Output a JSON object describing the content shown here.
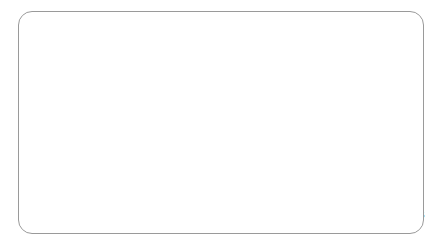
{
  "figure": {
    "frame_border_color": "#9a9a9a",
    "plot_background": "#e9e9e9",
    "page_background": "#ffffff"
  },
  "chart_data": {
    "type": "line",
    "title": "",
    "subtitle": "",
    "xlabel": "",
    "ylabel": "Age in years",
    "ylim": [
      35,
      65
    ],
    "yticks": [
      35,
      40,
      45,
      50,
      55,
      60,
      65
    ],
    "ytick_labels": [
      "35",
      "40",
      "45",
      "50",
      "55",
      "60",
      "65"
    ],
    "grid": "vertical-only",
    "legend_position": "top-left-inside",
    "x": [
      "1950–55",
      "1955–60",
      "1960–65",
      "1965–70",
      "1970–75",
      "1975–80",
      "1980–85",
      "1985–90",
      "1990–95",
      "1995–2000",
      "2000–05"
    ],
    "xtick_labels_shown": [
      "1950–55",
      "1960–65",
      "1970–75",
      "1980–85",
      "1990–95",
      "2000–05"
    ],
    "xtick_label_indices": [
      0,
      2,
      4,
      6,
      8,
      10
    ],
    "series": [
      {
        "name": "Zimbabwe",
        "color": "#3a3a3a",
        "width": 1.9,
        "values": [
          48.6,
          50.8,
          53.0,
          55.2,
          57.2,
          59.0,
          59.8,
          58.3,
          52.6,
          43.2,
          36.4
        ]
      },
      {
        "name": "South Africa",
        "color": "#4a4a4a",
        "width": 1.9,
        "values": [
          46.1,
          49.0,
          51.2,
          53.4,
          55.3,
          57.5,
          59.6,
          61.2,
          60.5,
          57.3,
          47.1
        ]
      },
      {
        "name": "Botswana",
        "color": "#555555",
        "width": 1.9,
        "values": [
          43.3,
          46.5,
          48.8,
          51.0,
          54.7,
          57.5,
          60.0,
          63.0,
          60.6,
          50.8,
          43.3
        ]
      },
      {
        "name": "Uganda",
        "color": "#8a8a8a",
        "width": 1.9,
        "values": [
          41.2,
          43.0,
          44.9,
          46.3,
          47.4,
          47.5,
          47.6,
          45.0,
          41.9,
          42.1,
          45.9
        ]
      },
      {
        "name": "Zambia",
        "color": "#5f5f5f",
        "width": 1.9,
        "values": [
          39.8,
          41.4,
          44.3,
          47.3,
          49.6,
          50.8,
          51.9,
          51.8,
          46.5,
          40.6,
          42.4
        ]
      }
    ]
  }
}
